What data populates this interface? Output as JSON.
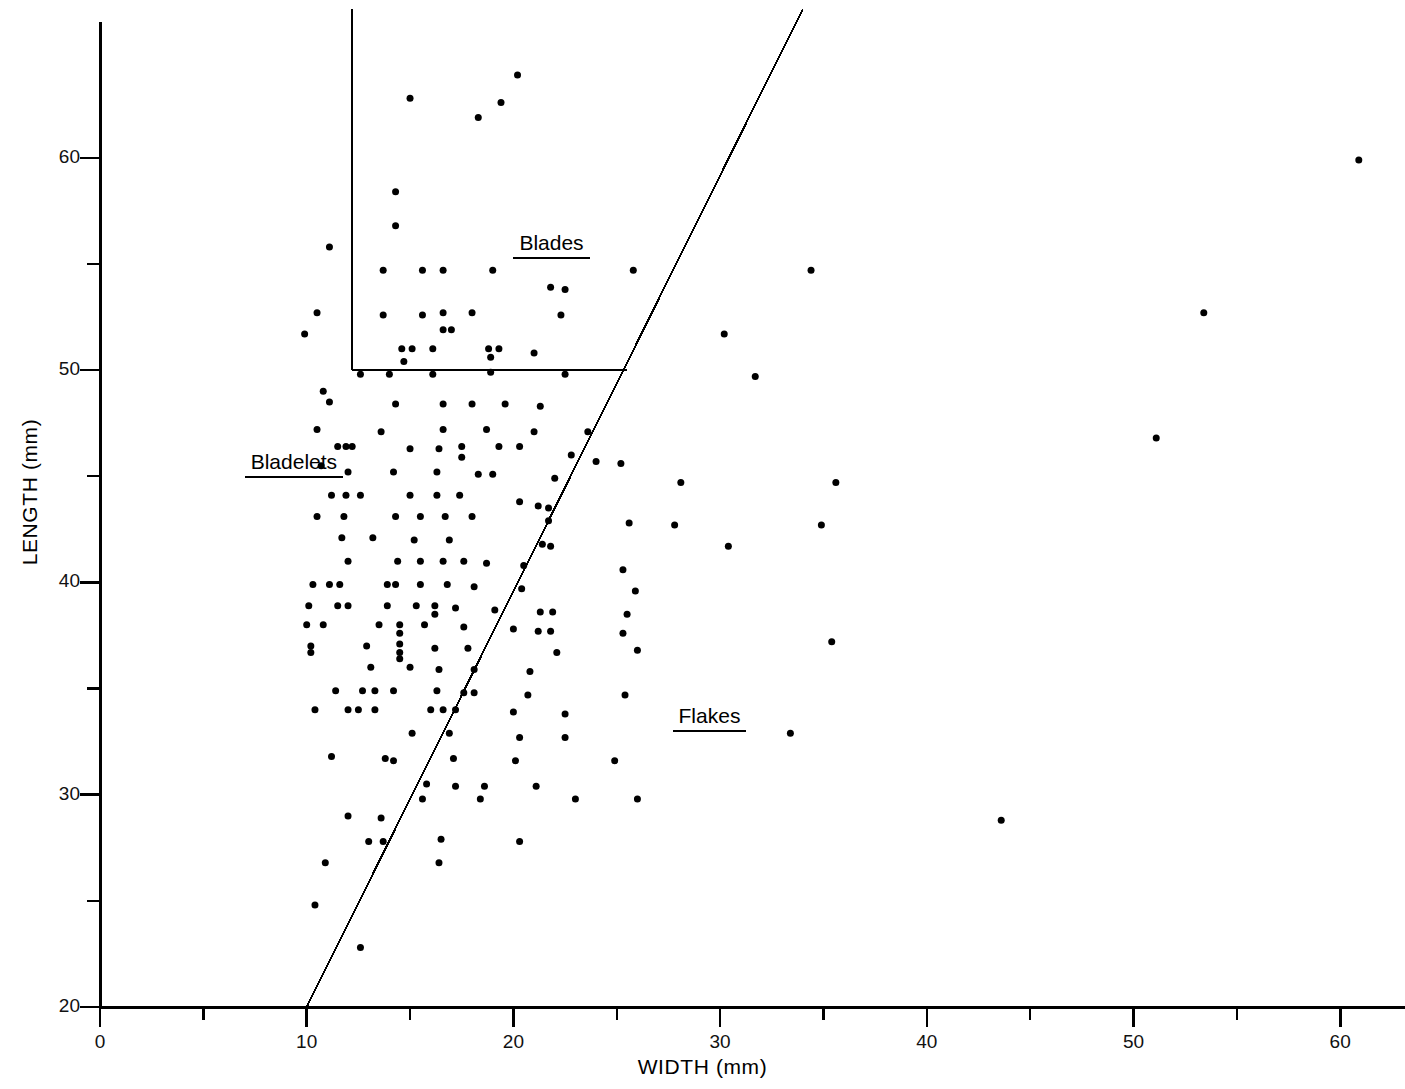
{
  "chart_data": {
    "type": "scatter",
    "title": "",
    "subtitle": "",
    "xlabel": "WIDTH  (mm)",
    "ylabel": "LENGTH  (mm)",
    "xlim": [
      0,
      63
    ],
    "ylim": [
      20,
      67
    ],
    "grid": false,
    "legend_position": "none",
    "x_ticks_major": [
      0,
      10,
      20,
      30,
      40,
      50,
      60
    ],
    "x_ticks_minor": [
      5,
      15,
      25,
      35,
      45,
      55
    ],
    "x_tick_labels": [
      "0",
      "10",
      "20",
      "30",
      "40",
      "50",
      "60"
    ],
    "y_ticks_major": [
      20,
      30,
      40,
      50,
      60
    ],
    "y_ticks_minor": [
      25,
      35,
      45,
      55
    ],
    "y_tick_labels": [
      "20",
      "30",
      "40",
      "50",
      "60"
    ],
    "marker": "filled-circle",
    "marker_color": "#000000",
    "marker_size_px": 7,
    "annotations": [
      {
        "name": "blades",
        "text": "Blades",
        "x": 20.0,
        "y": 55.9,
        "underline": true
      },
      {
        "name": "bladelets",
        "text": "Bladelets",
        "x": 7.0,
        "y": 45.6,
        "underline": true
      },
      {
        "name": "flakes",
        "text": "Flakes",
        "x": 27.7,
        "y": 33.6,
        "underline": true
      }
    ],
    "divider_lines": [
      {
        "name": "flake-blade-boundary",
        "type": "segment",
        "x1": 10.0,
        "y1": 20.0,
        "x2": 34.0,
        "y2": 67.0
      },
      {
        "name": "blades-box-vertical",
        "type": "segment",
        "x1": 12.2,
        "y1": 50.0,
        "x2": 12.2,
        "y2": 67.0
      },
      {
        "name": "blades-box-horizontal",
        "type": "segment",
        "x1": 12.2,
        "y1": 50.0,
        "x2": 25.5,
        "y2": 50.0
      }
    ],
    "points": [
      [
        20.2,
        63.9
      ],
      [
        15.0,
        62.8
      ],
      [
        19.4,
        62.6
      ],
      [
        18.3,
        61.9
      ],
      [
        11.1,
        55.8
      ],
      [
        25.8,
        54.7
      ],
      [
        34.4,
        54.7
      ],
      [
        14.3,
        58.4
      ],
      [
        14.3,
        56.8
      ],
      [
        10.5,
        52.7
      ],
      [
        9.9,
        51.7
      ],
      [
        13.7,
        54.7
      ],
      [
        15.6,
        54.7
      ],
      [
        16.6,
        54.7
      ],
      [
        19.0,
        54.7
      ],
      [
        21.8,
        53.9
      ],
      [
        22.5,
        53.8
      ],
      [
        13.7,
        52.6
      ],
      [
        16.6,
        52.7
      ],
      [
        18.0,
        52.7
      ],
      [
        15.6,
        52.6
      ],
      [
        16.6,
        51.9
      ],
      [
        17.0,
        51.9
      ],
      [
        22.3,
        52.6
      ],
      [
        30.2,
        51.7
      ],
      [
        14.6,
        51.0
      ],
      [
        15.1,
        51.0
      ],
      [
        16.1,
        51.0
      ],
      [
        18.8,
        51.0
      ],
      [
        19.3,
        51.0
      ],
      [
        21.0,
        50.8
      ],
      [
        14.7,
        50.4
      ],
      [
        18.9,
        50.6
      ],
      [
        18.9,
        49.9
      ],
      [
        12.6,
        49.8
      ],
      [
        14.0,
        49.8
      ],
      [
        16.1,
        49.8
      ],
      [
        22.5,
        49.8
      ],
      [
        31.7,
        49.7
      ],
      [
        10.8,
        49.0
      ],
      [
        11.1,
        48.5
      ],
      [
        14.3,
        48.4
      ],
      [
        16.6,
        48.4
      ],
      [
        18.0,
        48.4
      ],
      [
        19.6,
        48.4
      ],
      [
        21.3,
        48.3
      ],
      [
        10.5,
        47.2
      ],
      [
        13.6,
        47.1
      ],
      [
        16.6,
        47.2
      ],
      [
        18.7,
        47.2
      ],
      [
        21.0,
        47.1
      ],
      [
        23.6,
        47.1
      ],
      [
        11.5,
        46.4
      ],
      [
        11.9,
        46.4
      ],
      [
        12.2,
        46.4
      ],
      [
        15.0,
        46.3
      ],
      [
        16.4,
        46.3
      ],
      [
        17.5,
        46.4
      ],
      [
        17.5,
        45.9
      ],
      [
        19.3,
        46.4
      ],
      [
        20.3,
        46.4
      ],
      [
        22.8,
        46.0
      ],
      [
        24.0,
        45.7
      ],
      [
        25.2,
        45.6
      ],
      [
        10.7,
        45.5
      ],
      [
        12.0,
        45.2
      ],
      [
        14.2,
        45.2
      ],
      [
        16.3,
        45.2
      ],
      [
        18.3,
        45.1
      ],
      [
        19.0,
        45.1
      ],
      [
        22.0,
        44.9
      ],
      [
        28.1,
        44.7
      ],
      [
        35.6,
        44.7
      ],
      [
        11.2,
        44.1
      ],
      [
        11.9,
        44.1
      ],
      [
        12.6,
        44.1
      ],
      [
        15.0,
        44.1
      ],
      [
        16.3,
        44.1
      ],
      [
        17.4,
        44.1
      ],
      [
        20.3,
        43.8
      ],
      [
        21.2,
        43.6
      ],
      [
        21.7,
        43.5
      ],
      [
        10.5,
        43.1
      ],
      [
        11.8,
        43.1
      ],
      [
        14.3,
        43.1
      ],
      [
        15.5,
        43.1
      ],
      [
        16.7,
        43.1
      ],
      [
        18.0,
        43.1
      ],
      [
        21.7,
        42.9
      ],
      [
        25.6,
        42.8
      ],
      [
        27.8,
        42.7
      ],
      [
        34.9,
        42.7
      ],
      [
        11.7,
        42.1
      ],
      [
        13.2,
        42.1
      ],
      [
        15.2,
        42.0
      ],
      [
        16.9,
        42.0
      ],
      [
        21.4,
        41.8
      ],
      [
        21.8,
        41.7
      ],
      [
        30.4,
        41.7
      ],
      [
        12.0,
        41.0
      ],
      [
        14.4,
        41.0
      ],
      [
        15.5,
        41.0
      ],
      [
        16.6,
        41.0
      ],
      [
        17.6,
        41.0
      ],
      [
        18.7,
        40.9
      ],
      [
        20.5,
        40.8
      ],
      [
        25.3,
        40.6
      ],
      [
        10.3,
        39.9
      ],
      [
        11.1,
        39.9
      ],
      [
        11.6,
        39.9
      ],
      [
        13.9,
        39.9
      ],
      [
        14.3,
        39.9
      ],
      [
        15.5,
        39.9
      ],
      [
        16.8,
        39.9
      ],
      [
        18.1,
        39.8
      ],
      [
        20.4,
        39.7
      ],
      [
        25.9,
        39.6
      ],
      [
        10.1,
        38.9
      ],
      [
        11.5,
        38.9
      ],
      [
        12.0,
        38.9
      ],
      [
        13.9,
        38.9
      ],
      [
        15.3,
        38.9
      ],
      [
        16.2,
        38.9
      ],
      [
        16.2,
        38.5
      ],
      [
        17.2,
        38.8
      ],
      [
        19.1,
        38.7
      ],
      [
        21.3,
        38.6
      ],
      [
        21.9,
        38.6
      ],
      [
        25.5,
        38.5
      ],
      [
        10.0,
        38.0
      ],
      [
        10.8,
        38.0
      ],
      [
        13.5,
        38.0
      ],
      [
        14.5,
        38.0
      ],
      [
        14.5,
        37.6
      ],
      [
        15.7,
        38.0
      ],
      [
        17.6,
        37.9
      ],
      [
        20.0,
        37.8
      ],
      [
        21.2,
        37.7
      ],
      [
        21.8,
        37.7
      ],
      [
        25.3,
        37.6
      ],
      [
        10.2,
        37.0
      ],
      [
        10.2,
        36.7
      ],
      [
        12.9,
        37.0
      ],
      [
        14.5,
        37.1
      ],
      [
        14.5,
        36.7
      ],
      [
        14.5,
        36.4
      ],
      [
        16.2,
        36.9
      ],
      [
        17.8,
        36.9
      ],
      [
        22.1,
        36.7
      ],
      [
        26.0,
        36.8
      ],
      [
        35.4,
        37.2
      ],
      [
        13.1,
        36.0
      ],
      [
        15.0,
        36.0
      ],
      [
        16.4,
        35.9
      ],
      [
        18.1,
        35.9
      ],
      [
        20.8,
        35.8
      ],
      [
        11.4,
        34.9
      ],
      [
        12.7,
        34.9
      ],
      [
        13.3,
        34.9
      ],
      [
        14.2,
        34.9
      ],
      [
        16.3,
        34.9
      ],
      [
        17.6,
        34.8
      ],
      [
        18.1,
        34.8
      ],
      [
        20.7,
        34.7
      ],
      [
        25.4,
        34.7
      ],
      [
        10.4,
        34.0
      ],
      [
        12.0,
        34.0
      ],
      [
        12.5,
        34.0
      ],
      [
        13.3,
        34.0
      ],
      [
        16.0,
        34.0
      ],
      [
        16.6,
        34.0
      ],
      [
        17.2,
        34.0
      ],
      [
        20.0,
        33.9
      ],
      [
        22.5,
        33.8
      ],
      [
        33.4,
        32.9
      ],
      [
        15.1,
        32.9
      ],
      [
        16.9,
        32.9
      ],
      [
        20.3,
        32.7
      ],
      [
        22.5,
        32.7
      ],
      [
        11.2,
        31.8
      ],
      [
        13.8,
        31.7
      ],
      [
        14.2,
        31.6
      ],
      [
        17.1,
        31.7
      ],
      [
        20.1,
        31.6
      ],
      [
        24.9,
        31.6
      ],
      [
        15.8,
        30.5
      ],
      [
        17.2,
        30.4
      ],
      [
        18.6,
        30.4
      ],
      [
        21.1,
        30.4
      ],
      [
        15.6,
        29.8
      ],
      [
        18.4,
        29.8
      ],
      [
        23.0,
        29.8
      ],
      [
        26.0,
        29.8
      ],
      [
        12.0,
        29.0
      ],
      [
        13.6,
        28.9
      ],
      [
        43.6,
        28.8
      ],
      [
        13.0,
        27.8
      ],
      [
        13.7,
        27.8
      ],
      [
        16.5,
        27.9
      ],
      [
        20.3,
        27.8
      ],
      [
        10.9,
        26.8
      ],
      [
        16.4,
        26.8
      ],
      [
        10.4,
        24.8
      ],
      [
        12.6,
        22.8
      ],
      [
        51.1,
        46.8
      ],
      [
        53.4,
        52.7
      ],
      [
        60.9,
        59.9
      ]
    ]
  },
  "axes": {
    "x_axis_name": "width-axis",
    "y_axis_name": "length-axis"
  }
}
